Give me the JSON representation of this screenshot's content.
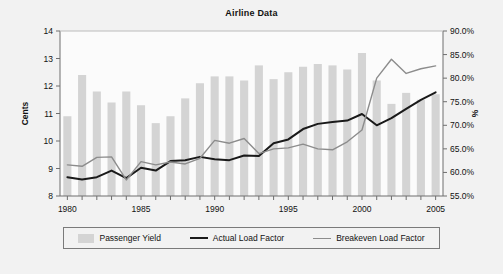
{
  "chart_data": {
    "type": "bar",
    "title": "Airline Data",
    "xlabel": "",
    "ylabel": "Cents",
    "y2label": "%",
    "grid": false,
    "legend_position": "bottom",
    "x": [
      1980,
      1981,
      1982,
      1983,
      1984,
      1985,
      1986,
      1987,
      1988,
      1989,
      1990,
      1991,
      1992,
      1993,
      1994,
      1995,
      1996,
      1997,
      1998,
      1999,
      2000,
      2001,
      2002,
      2003,
      2004,
      2005
    ],
    "categories": [
      "1980",
      "1981",
      "1982",
      "1983",
      "1984",
      "1985",
      "1986",
      "1987",
      "1988",
      "1989",
      "1990",
      "1991",
      "1992",
      "1993",
      "1994",
      "1995",
      "1996",
      "1997",
      "1998",
      "1999",
      "2000",
      "2001",
      "2002",
      "2003",
      "2004",
      "2005"
    ],
    "xticks": [
      "1980",
      "1985",
      "1990",
      "1995",
      "2000",
      "2005"
    ],
    "ylim": [
      8,
      14
    ],
    "yticks": [
      "8",
      "9",
      "10",
      "11",
      "12",
      "13",
      "14"
    ],
    "y2lim": [
      55.0,
      90.0
    ],
    "y2ticks": [
      "55.0%",
      "60.0%",
      "65.0%",
      "70.0%",
      "75.0%",
      "80.0%",
      "85.0%",
      "90.0%"
    ],
    "series": [
      {
        "name": "Passenger Yield",
        "type": "bar",
        "axis": "left",
        "unit": "Cents",
        "color": "#d4d4d4",
        "values": [
          10.9,
          12.4,
          11.8,
          11.4,
          11.8,
          11.3,
          10.65,
          10.9,
          11.55,
          12.1,
          12.35,
          12.35,
          12.2,
          12.75,
          12.25,
          12.5,
          12.7,
          12.8,
          12.75,
          12.6,
          13.2,
          12.2,
          11.35,
          11.75,
          11.5,
          11.7
        ]
      },
      {
        "name": "Actual Load Factor",
        "type": "line",
        "axis": "right",
        "unit": "%",
        "color": "#1a1a1a",
        "values": [
          59.0,
          58.5,
          59.0,
          60.4,
          58.8,
          61.0,
          60.4,
          62.4,
          62.6,
          63.3,
          62.8,
          62.6,
          63.6,
          63.5,
          66.2,
          67.0,
          69.2,
          70.3,
          70.7,
          71.0,
          72.4,
          70.0,
          71.5,
          73.5,
          75.4,
          77.0
        ]
      },
      {
        "name": "Breakeven Load Factor",
        "type": "line",
        "axis": "right",
        "unit": "%",
        "color": "#8c8c8c",
        "values": [
          61.6,
          61.3,
          63.2,
          63.3,
          58.4,
          62.3,
          61.6,
          62.2,
          61.8,
          63.0,
          66.8,
          66.2,
          67.2,
          64.0,
          65.0,
          65.2,
          66.0,
          65.0,
          64.8,
          66.5,
          69.0,
          80.0,
          84.0,
          81.0,
          82.0,
          82.6
        ]
      }
    ]
  },
  "legend": {
    "items": [
      {
        "label": "Passenger Yield",
        "marker": "bar-swatch"
      },
      {
        "label": "Actual Load Factor",
        "marker": "line-swatch-black"
      },
      {
        "label": "Breakeven Load Factor",
        "marker": "line-swatch-grey"
      }
    ]
  },
  "colors": {
    "background": "#f2f2f2",
    "plot_background": "#fbfbfb",
    "bar": "#d4d4d4",
    "actual_line": "#1a1a1a",
    "breakeven_line": "#8c8c8c",
    "axis": "#6e6e6e",
    "text": "#111111"
  }
}
